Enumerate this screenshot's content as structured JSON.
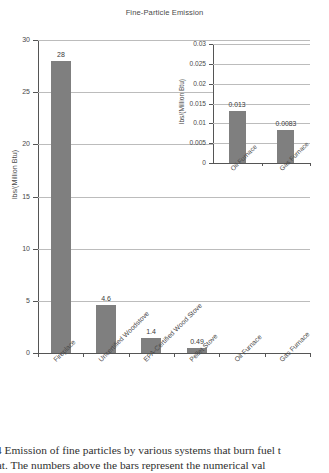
{
  "chart_data": {
    "type": "bar",
    "title": "Fine-Particle Emission",
    "xlabel": "",
    "ylabel": "lbs/(Million Btu)",
    "ylim": [
      0,
      30
    ],
    "yticks": [
      "0",
      "5",
      "10",
      "15",
      "20",
      "25",
      "30"
    ],
    "ytick_values": [
      0,
      5,
      10,
      15,
      20,
      25,
      30
    ],
    "grid": true,
    "legend": "none",
    "categories": [
      "Fireplace",
      "Uncertified Woodstove",
      "EPA-Certified Wood Stove",
      "Pellet Stove",
      "Oil Furnace",
      "Gas Furnace"
    ],
    "values": [
      28,
      4.6,
      1.4,
      0.49,
      0.013,
      0.0083
    ],
    "value_labels": [
      "28",
      "4.6",
      "1.4",
      "0.49",
      "",
      ""
    ],
    "bar_color": "#7f7f7f",
    "inset": {
      "type": "bar",
      "title": "",
      "ylabel": "lbs/(Million Btu)",
      "ylim": [
        0,
        0.03
      ],
      "yticks": [
        "0",
        "0.005",
        "0.01",
        "0.015",
        "0.02",
        "0.025",
        "0.03"
      ],
      "ytick_values": [
        0,
        0.005,
        0.01,
        0.015,
        0.02,
        0.025,
        0.03
      ],
      "grid": true,
      "categories": [
        "Oil Furnace",
        "Gas Furnace"
      ],
      "values": [
        0.013,
        0.0083
      ],
      "value_labels": [
        "0.013",
        "0.0083"
      ],
      "bar_color": "#7f7f7f"
    }
  },
  "caption": {
    "line1": "4  Emission of fine particles by various systems that burn fuel t",
    "line2": "heat. The numbers above the bars represent the numerical val"
  }
}
